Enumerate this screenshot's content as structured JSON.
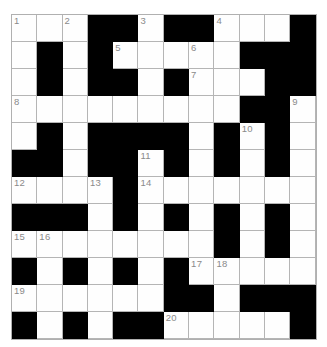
{
  "puzzle": {
    "type": "crossword-grid",
    "title": "",
    "rows": 12,
    "cols": 12,
    "colors": {
      "block": "#000000",
      "cell": "#fefefe",
      "gridline": "#b5b5b5",
      "number": "#8a8a8a",
      "background": "#ffffff"
    },
    "legend": {
      "W": "open letter cell",
      "B": "blocked cell"
    },
    "grid": [
      [
        "W",
        "W",
        "W",
        "B",
        "B",
        "W",
        "B",
        "B",
        "W",
        "W",
        "W",
        "B"
      ],
      [
        "W",
        "B",
        "W",
        "B",
        "W",
        "W",
        "W",
        "W",
        "W",
        "B",
        "B",
        "B"
      ],
      [
        "W",
        "B",
        "W",
        "B",
        "B",
        "W",
        "B",
        "W",
        "W",
        "W",
        "B",
        "B"
      ],
      [
        "W",
        "W",
        "W",
        "W",
        "W",
        "W",
        "W",
        "W",
        "W",
        "B",
        "B",
        "W"
      ],
      [
        "W",
        "B",
        "W",
        "B",
        "B",
        "B",
        "B",
        "W",
        "B",
        "W",
        "B",
        "W"
      ],
      [
        "B",
        "B",
        "W",
        "B",
        "B",
        "W",
        "B",
        "W",
        "B",
        "W",
        "B",
        "W"
      ],
      [
        "W",
        "W",
        "W",
        "W",
        "B",
        "W",
        "W",
        "W",
        "W",
        "W",
        "W",
        "W"
      ],
      [
        "B",
        "B",
        "B",
        "W",
        "B",
        "W",
        "B",
        "W",
        "B",
        "W",
        "B",
        "W"
      ],
      [
        "W",
        "W",
        "W",
        "W",
        "W",
        "W",
        "W",
        "W",
        "B",
        "W",
        "B",
        "W"
      ],
      [
        "B",
        "W",
        "B",
        "W",
        "B",
        "W",
        "B",
        "W",
        "W",
        "W",
        "W",
        "W"
      ],
      [
        "W",
        "W",
        "W",
        "W",
        "W",
        "W",
        "B",
        "B",
        "W",
        "B",
        "B",
        "B"
      ],
      [
        "B",
        "W",
        "B",
        "W",
        "B",
        "B",
        "W",
        "W",
        "W",
        "W",
        "W",
        "B"
      ]
    ],
    "numbers": [
      {
        "n": "1",
        "row": 0,
        "col": 0
      },
      {
        "n": "2",
        "row": 0,
        "col": 2
      },
      {
        "n": "3",
        "row": 0,
        "col": 5
      },
      {
        "n": "4",
        "row": 0,
        "col": 8
      },
      {
        "n": "5",
        "row": 1,
        "col": 4
      },
      {
        "n": "6",
        "row": 1,
        "col": 7
      },
      {
        "n": "7",
        "row": 2,
        "col": 7
      },
      {
        "n": "8",
        "row": 3,
        "col": 0
      },
      {
        "n": "9",
        "row": 3,
        "col": 11
      },
      {
        "n": "10",
        "row": 4,
        "col": 9
      },
      {
        "n": "11",
        "row": 5,
        "col": 5
      },
      {
        "n": "12",
        "row": 6,
        "col": 0
      },
      {
        "n": "13",
        "row": 6,
        "col": 3
      },
      {
        "n": "14",
        "row": 6,
        "col": 5
      },
      {
        "n": "15",
        "row": 8,
        "col": 0
      },
      {
        "n": "16",
        "row": 8,
        "col": 1
      },
      {
        "n": "17",
        "row": 9,
        "col": 7
      },
      {
        "n": "18",
        "row": 9,
        "col": 8
      },
      {
        "n": "19",
        "row": 10,
        "col": 0
      },
      {
        "n": "20",
        "row": 11,
        "col": 6
      }
    ],
    "entries": []
  }
}
